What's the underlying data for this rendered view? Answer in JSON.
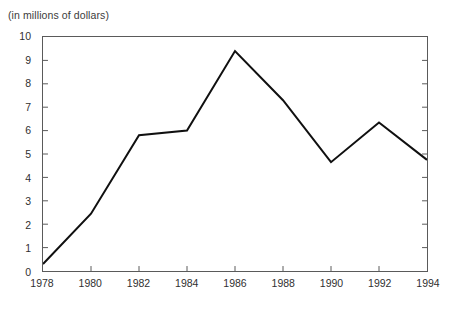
{
  "caption": "(in millions of dollars)",
  "chart_data": {
    "type": "line",
    "title": "(in millions of dollars)",
    "xlabel": "",
    "ylabel": "",
    "categories": [
      1978,
      1980,
      1982,
      1984,
      1986,
      1988,
      1990,
      1992,
      1994
    ],
    "x": [
      1978,
      1980,
      1982,
      1984,
      1986,
      1988,
      1990,
      1992,
      1994
    ],
    "values": [
      0.3,
      2.45,
      5.8,
      6.0,
      9.4,
      7.3,
      4.65,
      6.35,
      4.75
    ],
    "series": [
      {
        "name": "",
        "values": [
          0.3,
          2.45,
          5.8,
          6.0,
          9.4,
          7.3,
          4.65,
          6.35,
          4.75
        ],
        "color": "#101010"
      }
    ],
    "xlim": [
      1978,
      1994
    ],
    "ylim": [
      0,
      10
    ],
    "ytick_values": [
      0,
      1,
      2,
      3,
      4,
      5,
      6,
      7,
      8,
      9,
      10
    ],
    "ytick_labels": [
      "0",
      "1",
      "2",
      "3",
      "4",
      "5",
      "6",
      "7",
      "8",
      "9",
      "10"
    ],
    "xtick_values": [
      1978,
      1980,
      1982,
      1984,
      1986,
      1988,
      1990,
      1992,
      1994
    ],
    "xtick_labels": [
      "1978",
      "1980",
      "1982",
      "1984",
      "1986",
      "1988",
      "1990",
      "1992",
      "1994"
    ],
    "grid": false,
    "legend": false,
    "legend_position": "none",
    "frame_color": "#5a5a5a",
    "background": "#ffffff",
    "line_width": 2
  }
}
